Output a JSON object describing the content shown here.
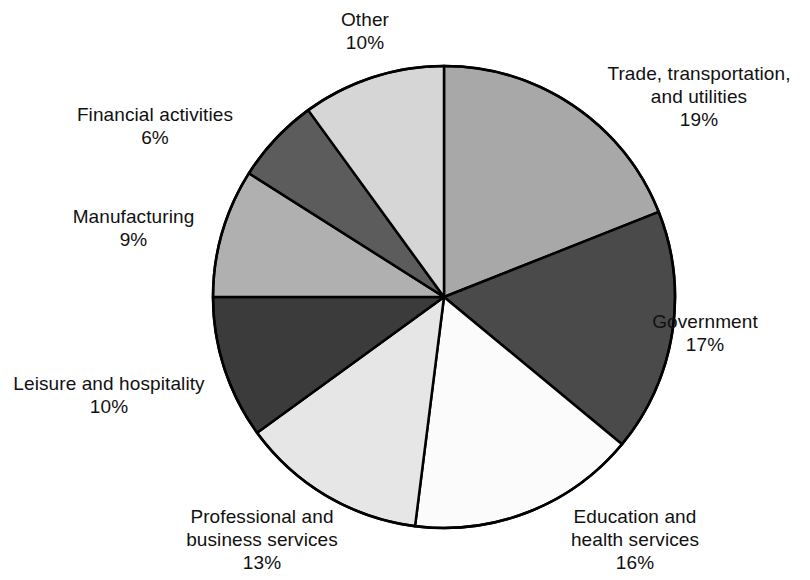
{
  "chart_data": {
    "type": "pie",
    "title": "",
    "subtitle": "",
    "xlabel": "",
    "ylabel": "",
    "legend_position": "none",
    "grid": false,
    "start_angle_deg": 0,
    "direction": "clockwise",
    "units": "percent",
    "categories": [
      "Trade, transportation, and utilities",
      "Government",
      "Education and health services",
      "Professional and business services",
      "Leisure and hospitality",
      "Manufacturing",
      "Financial activities",
      "Other"
    ],
    "values": [
      19,
      17,
      16,
      13,
      10,
      9,
      6,
      10
    ],
    "slices": [
      {
        "id": "trade",
        "label_line1": "Trade, transportation,",
        "label_line2": "and utilities",
        "percent_text": "19%",
        "value": 19,
        "color": "#a8a8a8"
      },
      {
        "id": "government",
        "label_line1": "Government",
        "label_line2": "",
        "percent_text": "17%",
        "value": 17,
        "color": "#4a4a4a"
      },
      {
        "id": "education",
        "label_line1": "Education and",
        "label_line2": "health services",
        "percent_text": "16%",
        "value": 16,
        "color": "#fbfbfb"
      },
      {
        "id": "professional",
        "label_line1": "Professional and",
        "label_line2": "business services",
        "percent_text": "13%",
        "value": 13,
        "color": "#e6e6e6"
      },
      {
        "id": "leisure",
        "label_line1": "Leisure and hospitality",
        "label_line2": "",
        "percent_text": "10%",
        "value": 10,
        "color": "#3b3b3b"
      },
      {
        "id": "manufacturing",
        "label_line1": "Manufacturing",
        "label_line2": "",
        "percent_text": "9%",
        "value": 9,
        "color": "#b0b0b0"
      },
      {
        "id": "financial",
        "label_line1": "Financial activities",
        "label_line2": "",
        "percent_text": "6%",
        "value": 6,
        "color": "#5c5c5c"
      },
      {
        "id": "other",
        "label_line1": "Other",
        "label_line2": "",
        "percent_text": "10%",
        "value": 10,
        "color": "#d6d6d6"
      }
    ],
    "geometry": {
      "center_x": 444,
      "center_y": 297,
      "radius": 231,
      "stroke_color": "#000000",
      "stroke_width": 2.5
    }
  }
}
